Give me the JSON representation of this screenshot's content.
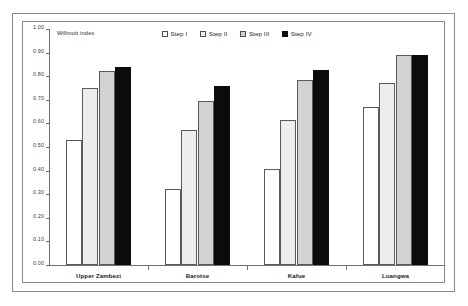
{
  "chart_data": {
    "type": "bar",
    "title": "",
    "axis_title": "Willmott index",
    "xlabel": "",
    "ylabel": "Willmott index",
    "ylim": [
      0.0,
      1.0
    ],
    "ytick_step": 0.1,
    "grid": false,
    "legend_position": "top-center",
    "categories": [
      "Upper Zambezi",
      "Barotse",
      "Kafue",
      "Luangwa"
    ],
    "ytick_labels": [
      "0.00",
      "0.10",
      "0.20",
      "0.30",
      "0.40",
      "0.50",
      "0.60",
      "0.70",
      "0.80",
      "0.90",
      "1.00"
    ],
    "series": [
      {
        "name": "Step I",
        "swatch": "#ffffff",
        "values": [
          0.53,
          0.32,
          0.405,
          0.67
        ]
      },
      {
        "name": "Step II",
        "swatch": "#ededed",
        "values": [
          0.75,
          0.57,
          0.615,
          0.77
        ]
      },
      {
        "name": "Step III",
        "swatch": "#d2d2d2",
        "values": [
          0.82,
          0.695,
          0.785,
          0.89
        ]
      },
      {
        "name": "Step IV",
        "swatch": "#0b0b0b",
        "values": [
          0.84,
          0.76,
          0.825,
          0.89
        ]
      }
    ]
  },
  "colors": {
    "frame": "#8a8a8a",
    "axis": "#6f6f6f",
    "bar_outline": "#5a5a5a",
    "text": "#1a1a1a"
  }
}
